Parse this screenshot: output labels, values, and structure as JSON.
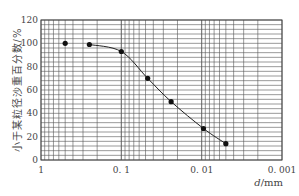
{
  "chart_data": {
    "type": "line",
    "title": "",
    "xlabel": "d/mm",
    "xlabel_italic": "d",
    "xlabel_unit": "/mm",
    "ylabel": "小于某粒径沙重百分数/%",
    "xscale": "log-reversed",
    "xlim": [
      1,
      0.001
    ],
    "ylim": [
      0,
      120
    ],
    "x_ticks": [
      "1",
      "0.1",
      "0.01",
      "0.001"
    ],
    "x_tick_values": [
      1,
      0.1,
      0.01,
      0.001
    ],
    "y_ticks": [
      "0",
      "20",
      "40",
      "60",
      "80",
      "100",
      "120"
    ],
    "y_tick_values": [
      0,
      20,
      40,
      60,
      80,
      100,
      120
    ],
    "grid": true,
    "legend": null,
    "series": [
      {
        "name": "grain size distribution",
        "x": [
          0.5,
          0.25,
          0.1,
          0.047,
          0.024,
          0.0095,
          0.005
        ],
        "y": [
          100,
          99,
          93,
          70,
          50,
          27,
          14
        ],
        "markers": "filled-circle",
        "line_starts_at_index": 1
      }
    ]
  },
  "colors": {
    "line": "#222222",
    "grid": "#555555",
    "marker": "#111111"
  }
}
